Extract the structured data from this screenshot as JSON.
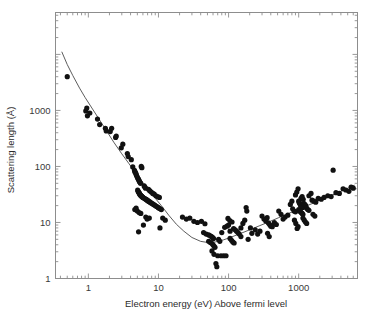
{
  "chart_data": {
    "type": "scatter",
    "title": "",
    "xlabel": "Electron energy (eV) Above fermi level",
    "ylabel": "Scattering length (Å)",
    "xscale": "log",
    "yscale": "log",
    "xlim": [
      0.34,
      6900
    ],
    "ylim": [
      1,
      56000
    ],
    "grid": false,
    "legend": null,
    "x_tick_labels": [
      "1",
      "10",
      "100",
      "1000"
    ],
    "x_tick_values": [
      1,
      10,
      100,
      1000
    ],
    "y_tick_labels": [
      "1",
      "10",
      "100",
      "1000"
    ],
    "y_tick_values": [
      1,
      10,
      100,
      1000
    ],
    "marker": {
      "shape": "circle",
      "color": "#111111",
      "size": 2.6
    },
    "curve": {
      "name": "universal curve fit",
      "color": "#4a4a4a",
      "width": 0.9,
      "minimum_x": 45,
      "minimum_y": 4.4,
      "points": [
        [
          0.42,
          11000
        ],
        [
          0.5,
          6600
        ],
        [
          0.6,
          4200
        ],
        [
          0.75,
          2500
        ],
        [
          0.9,
          1700
        ],
        [
          1.1,
          1150
        ],
        [
          1.4,
          720
        ],
        [
          1.8,
          440
        ],
        [
          2.3,
          272
        ],
        [
          3.0,
          168
        ],
        [
          3.8,
          112
        ],
        [
          4.8,
          75
        ],
        [
          6.0,
          52
        ],
        [
          7.5,
          36
        ],
        [
          9.0,
          27
        ],
        [
          11.0,
          20
        ],
        [
          14.0,
          13.5
        ],
        [
          18.0,
          9.3
        ],
        [
          23.0,
          7.0
        ],
        [
          30.0,
          5.4
        ],
        [
          40.0,
          4.6
        ],
        [
          50.0,
          4.4
        ],
        [
          65.0,
          4.5
        ],
        [
          85.0,
          4.9
        ],
        [
          110.0,
          5.5
        ],
        [
          150.0,
          6.4
        ],
        [
          200.0,
          7.4
        ],
        [
          280.0,
          8.8
        ],
        [
          380.0,
          10.3
        ],
        [
          520.0,
          12.2
        ],
        [
          700.0,
          14.3
        ],
        [
          950.0,
          16.8
        ],
        [
          1300.0,
          19.8
        ],
        [
          1800.0,
          23.5
        ],
        [
          2500.0,
          28.0
        ],
        [
          3400.0,
          33.0
        ],
        [
          4600.0,
          39.0
        ],
        [
          6200.0,
          46.0
        ]
      ]
    },
    "series": [
      {
        "name": "scattering length measurements",
        "points": [
          [
            0.5,
            4000
          ],
          [
            0.92,
            980
          ],
          [
            0.95,
            1100
          ],
          [
            0.97,
            800
          ],
          [
            1.05,
            900
          ],
          [
            1.35,
            700
          ],
          [
            1.45,
            560
          ],
          [
            1.75,
            480
          ],
          [
            1.8,
            430
          ],
          [
            2.05,
            420
          ],
          [
            2.15,
            480
          ],
          [
            2.45,
            330
          ],
          [
            2.5,
            350
          ],
          [
            2.95,
            215
          ],
          [
            3.1,
            250
          ],
          [
            3.6,
            170
          ],
          [
            3.7,
            150
          ],
          [
            4.1,
            132
          ],
          [
            4.3,
            98
          ],
          [
            4.55,
            85
          ],
          [
            4.62,
            80
          ],
          [
            4.7,
            78
          ],
          [
            4.78,
            74
          ],
          [
            4.85,
            70
          ],
          [
            4.95,
            66
          ],
          [
            5.05,
            62
          ],
          [
            5.15,
            60
          ],
          [
            5.25,
            57
          ],
          [
            5.35,
            54
          ],
          [
            5.45,
            52
          ],
          [
            5.55,
            50
          ],
          [
            5.68,
            100
          ],
          [
            5.8,
            95
          ],
          [
            5.05,
            38
          ],
          [
            5.12,
            36
          ],
          [
            5.2,
            35
          ],
          [
            5.28,
            34
          ],
          [
            5.35,
            33
          ],
          [
            5.42,
            32
          ],
          [
            5.5,
            31
          ],
          [
            5.58,
            30.5
          ],
          [
            5.66,
            30
          ],
          [
            5.74,
            29.5
          ],
          [
            5.82,
            29
          ],
          [
            5.9,
            28.5
          ],
          [
            6.0,
            28
          ],
          [
            6.1,
            27.5
          ],
          [
            6.25,
            45
          ],
          [
            6.4,
            43
          ],
          [
            6.55,
            41
          ],
          [
            6.3,
            27
          ],
          [
            6.45,
            26.5
          ],
          [
            6.6,
            26
          ],
          [
            6.75,
            25.5
          ],
          [
            6.9,
            25
          ],
          [
            7.05,
            24.5
          ],
          [
            7.2,
            24
          ],
          [
            7.4,
            23.5
          ],
          [
            7.6,
            23
          ],
          [
            7.8,
            22.5
          ],
          [
            8.0,
            22
          ],
          [
            8.25,
            21.5
          ],
          [
            8.5,
            21
          ],
          [
            8.75,
            20.5
          ],
          [
            9.0,
            20
          ],
          [
            9.3,
            19.5
          ],
          [
            9.6,
            19
          ],
          [
            9.9,
            18.5
          ],
          [
            10.2,
            18
          ],
          [
            10.6,
            17.5
          ],
          [
            11.0,
            17
          ],
          [
            7.2,
            39
          ],
          [
            7.5,
            37
          ],
          [
            7.9,
            35
          ],
          [
            8.3,
            33
          ],
          [
            8.7,
            32
          ],
          [
            9.2,
            30
          ],
          [
            9.7,
            29
          ],
          [
            10.3,
            28
          ],
          [
            4.6,
            17
          ],
          [
            4.8,
            18
          ],
          [
            5.0,
            16
          ],
          [
            5.3,
            15
          ],
          [
            5.6,
            14.5
          ],
          [
            5.2,
            6.8
          ],
          [
            6.1,
            9.0
          ],
          [
            6.6,
            12.5
          ],
          [
            6.9,
            11.5
          ],
          [
            7.4,
            12.0
          ],
          [
            10.5,
            8.0
          ],
          [
            11.5,
            12.0
          ],
          [
            12.5,
            11.0
          ],
          [
            22.0,
            12.5
          ],
          [
            25.0,
            11.5
          ],
          [
            28.0,
            12.0
          ],
          [
            32.0,
            10.5
          ],
          [
            36.0,
            10.0
          ],
          [
            41.0,
            10.5
          ],
          [
            46.0,
            9.5
          ],
          [
            44.0,
            6.6
          ],
          [
            48.0,
            6.2
          ],
          [
            52.0,
            6.0
          ],
          [
            55.0,
            5.8
          ],
          [
            57.0,
            5.6
          ],
          [
            59.0,
            5.4
          ],
          [
            61.0,
            5.2
          ],
          [
            52.0,
            4.6
          ],
          [
            55.0,
            4.4
          ],
          [
            58.0,
            4.2
          ],
          [
            60.0,
            4.0
          ],
          [
            62.0,
            3.8
          ],
          [
            64.0,
            3.6
          ],
          [
            58.0,
            3.1
          ],
          [
            62.0,
            2.7
          ],
          [
            66.0,
            1.85
          ],
          [
            68.0,
            1.62
          ],
          [
            70.0,
            2.55
          ],
          [
            78.0,
            2.55
          ],
          [
            85.0,
            2.55
          ],
          [
            92.0,
            2.55
          ],
          [
            72.0,
            5.0
          ],
          [
            75.0,
            4.6
          ],
          [
            80.0,
            6.6
          ],
          [
            88.0,
            8.2
          ],
          [
            95.0,
            8.6
          ],
          [
            100.0,
            9.0
          ],
          [
            105.0,
            7.0
          ],
          [
            98.0,
            11.8
          ],
          [
            104.0,
            10.8
          ],
          [
            112.0,
            10.2
          ],
          [
            105.0,
            5.2
          ],
          [
            110.0,
            4.8
          ],
          [
            115.0,
            4.5
          ],
          [
            120.0,
            4.3
          ],
          [
            118.0,
            7.8
          ],
          [
            124.0,
            7.4
          ],
          [
            130.0,
            7.0
          ],
          [
            136.0,
            6.6
          ],
          [
            142.0,
            6.2
          ],
          [
            150.0,
            5.6
          ],
          [
            150.0,
            8.0
          ],
          [
            160.0,
            9.6
          ],
          [
            170.0,
            11.0
          ],
          [
            178.0,
            18.5
          ],
          [
            182.0,
            16.0
          ],
          [
            190.0,
            5.0
          ],
          [
            205.0,
            8.0
          ],
          [
            215.0,
            6.4
          ],
          [
            240.0,
            7.4
          ],
          [
            260.0,
            6.2
          ],
          [
            280.0,
            7.0
          ],
          [
            300.0,
            13.0
          ],
          [
            320.0,
            11.5
          ],
          [
            340.0,
            10.6
          ],
          [
            355.0,
            12.2
          ],
          [
            370.0,
            9.8
          ],
          [
            385.0,
            9.2
          ],
          [
            400.0,
            8.6
          ],
          [
            360.0,
            6.4
          ],
          [
            380.0,
            5.6
          ],
          [
            420.0,
            8.4
          ],
          [
            450.0,
            10.0
          ],
          [
            480.0,
            9.2
          ],
          [
            520.0,
            16.0
          ],
          [
            560.0,
            14.0
          ],
          [
            600.0,
            11.5
          ],
          [
            640.0,
            12.5
          ],
          [
            700.0,
            13.5
          ],
          [
            760.0,
            21.0
          ],
          [
            800.0,
            24.0
          ],
          [
            820.0,
            17.5
          ],
          [
            860.0,
            16.0
          ],
          [
            900.0,
            15.5
          ],
          [
            870.0,
            11.0
          ],
          [
            910.0,
            9.6
          ],
          [
            950.0,
            7.8
          ],
          [
            980.0,
            8.4
          ],
          [
            900.0,
            31.0
          ],
          [
            940.0,
            35.0
          ],
          [
            980.0,
            40.0
          ],
          [
            1000.0,
            24.0
          ],
          [
            1020.0,
            22.5
          ],
          [
            1040.0,
            21.5
          ],
          [
            1060.0,
            20.5
          ],
          [
            1080.0,
            20.0
          ],
          [
            1100.0,
            19.5
          ],
          [
            1120.0,
            19.0
          ],
          [
            1140.0,
            18.5
          ],
          [
            1000.0,
            17.0
          ],
          [
            1030.0,
            16.2
          ],
          [
            1060.0,
            15.5
          ],
          [
            1090.0,
            15.0
          ],
          [
            1120.0,
            14.5
          ],
          [
            1150.0,
            14.0
          ],
          [
            1080.0,
            27.0
          ],
          [
            1120.0,
            29.0
          ],
          [
            1160.0,
            26.0
          ],
          [
            1180.0,
            22.0
          ],
          [
            1220.0,
            21.0
          ],
          [
            1260.0,
            20.0
          ],
          [
            1150.0,
            12.0
          ],
          [
            1200.0,
            11.0
          ],
          [
            1250.0,
            10.2
          ],
          [
            1300.0,
            9.6
          ],
          [
            1300.0,
            18.0
          ],
          [
            1350.0,
            17.0
          ],
          [
            1400.0,
            16.5
          ],
          [
            1400.0,
            30.0
          ],
          [
            1500.0,
            33.0
          ],
          [
            1550.0,
            25.0
          ],
          [
            1650.0,
            24.0
          ],
          [
            1750.0,
            23.0
          ],
          [
            1600.0,
            14.0
          ],
          [
            1700.0,
            13.0
          ],
          [
            1900.0,
            27.0
          ],
          [
            2100.0,
            26.0
          ],
          [
            2300.0,
            28.0
          ],
          [
            2600.0,
            30.0
          ],
          [
            2900.0,
            29.0
          ],
          [
            3100.0,
            86.0
          ],
          [
            3400.0,
            34.0
          ],
          [
            3800.0,
            33.0
          ],
          [
            4300.0,
            40.0
          ],
          [
            4700.0,
            38.0
          ],
          [
            5200.0,
            36.0
          ],
          [
            5600.0,
            43.0
          ],
          [
            6000.0,
            41.0
          ]
        ]
      }
    ]
  },
  "axes": {
    "x_label": "Electron energy (eV) Above fermi level",
    "y_label": "Scattering length (Å)",
    "x_ticks": [
      "1",
      "10",
      "100",
      "1000"
    ],
    "y_ticks": [
      "1000",
      "100",
      "10",
      "1"
    ]
  },
  "style": {
    "frame_color": "#8d8d8d",
    "marker_color": "#111111",
    "curve_color": "#4a4a4a",
    "text_color": "#2b2b2b",
    "background": "#ffffff"
  }
}
